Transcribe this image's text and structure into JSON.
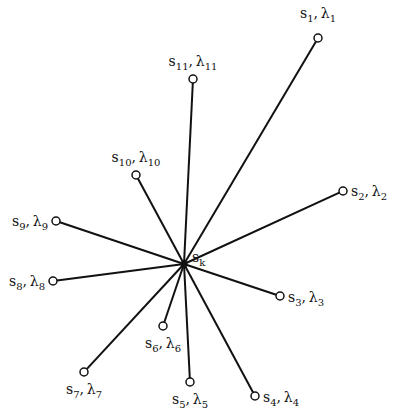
{
  "diagram": {
    "type": "star-graph",
    "hub": {
      "id": "k",
      "label": "s",
      "label_sub": "k",
      "x": 184,
      "y": 264
    },
    "colors": {
      "line": "#111111",
      "node_fill": "#ffffff",
      "node_stroke": "#111111",
      "background": "#ffffff"
    },
    "nodes": [
      {
        "id": "1",
        "s_sub": "1",
        "lambda_sub": "1",
        "x": 318,
        "y": 38
      },
      {
        "id": "2",
        "s_sub": "2",
        "lambda_sub": "2",
        "x": 343,
        "y": 191
      },
      {
        "id": "3",
        "s_sub": "3",
        "lambda_sub": "3",
        "x": 280,
        "y": 296
      },
      {
        "id": "4",
        "s_sub": "4",
        "lambda_sub": "4",
        "x": 255,
        "y": 396
      },
      {
        "id": "5",
        "s_sub": "5",
        "lambda_sub": "5",
        "x": 190,
        "y": 382
      },
      {
        "id": "6",
        "s_sub": "6",
        "lambda_sub": "6",
        "x": 163,
        "y": 326
      },
      {
        "id": "7",
        "s_sub": "7",
        "lambda_sub": "7",
        "x": 84,
        "y": 372
      },
      {
        "id": "8",
        "s_sub": "8",
        "lambda_sub": "8",
        "x": 53,
        "y": 281
      },
      {
        "id": "9",
        "s_sub": "9",
        "lambda_sub": "9",
        "x": 56,
        "y": 221
      },
      {
        "id": "10",
        "s_sub": "10",
        "lambda_sub": "10",
        "x": 136,
        "y": 175
      },
      {
        "id": "11",
        "s_sub": "11",
        "lambda_sub": "11",
        "x": 193,
        "y": 79
      }
    ]
  }
}
